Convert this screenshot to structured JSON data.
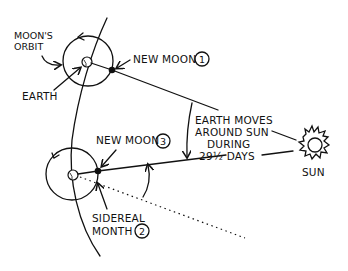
{
  "diagram": {
    "labels": {
      "moons_orbit_line1": "MOON'S",
      "moons_orbit_line2": "ORBIT",
      "earth": "EARTH",
      "new_moon_1": "NEW MOON",
      "new_moon_1_num": "1",
      "new_moon_3": "NEW MOON",
      "new_moon_3_num": "3",
      "sidereal_line1": "SIDEREAL",
      "sidereal_line2": "MONTH",
      "sidereal_num": "2",
      "earth_moves_line1": "EARTH MOVES",
      "earth_moves_line2": "AROUND SUN",
      "earth_moves_line3": "DURING",
      "earth_moves_line4": "29½ DAYS",
      "sun": "SUN"
    },
    "colors": {
      "ink": "#111111",
      "background": "#ffffff"
    }
  }
}
